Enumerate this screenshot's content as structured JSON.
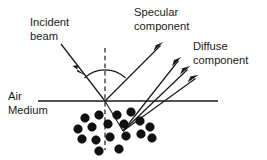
{
  "diagram": {
    "background_color": "#ffffff",
    "ink_color": "#1a1a1a",
    "particle_color": "#111111",
    "width": 267,
    "height": 160,
    "labels": {
      "incident_line1": "Incident",
      "incident_line2": "beam",
      "specular_line1": "Specular",
      "specular_line2": "component",
      "diffuse_line1": "Diffuse",
      "diffuse_line2": "component",
      "air": "Air",
      "medium": "Medium"
    },
    "geometry": {
      "interface": {
        "x1": 38,
        "y1": 101,
        "x2": 218,
        "y2": 101
      },
      "origin": {
        "x": 105,
        "y": 101
      },
      "normal": {
        "x": 105,
        "y_top": 48,
        "y_bottom": 150
      },
      "angle_arc": {
        "radius": 30,
        "start_deg": 133,
        "end_deg": 47
      },
      "incident_ray": {
        "x1": 61,
        "y1": 44,
        "x2": 105,
        "y2": 101
      },
      "incident_arrowhead_at": {
        "x": 80,
        "y": 69,
        "angle_deg": 52
      },
      "specular_ray": {
        "x1": 105,
        "y1": 101,
        "x2": 163,
        "y2": 42
      },
      "refracted_ray": {
        "x1": 105,
        "y1": 101,
        "x2": 123,
        "y2": 131
      },
      "scatter_point": {
        "x": 123,
        "y": 131
      },
      "diffuse_rays": [
        {
          "x1": 123,
          "y1": 131,
          "x2": 181,
          "y2": 57
        },
        {
          "x1": 123,
          "y1": 131,
          "x2": 190,
          "y2": 66
        },
        {
          "x1": 123,
          "y1": 131,
          "x2": 198,
          "y2": 75
        }
      ]
    },
    "particles": [
      {
        "cx": 85,
        "cy": 118,
        "r": 4.3
      },
      {
        "cx": 99,
        "cy": 115,
        "r": 4.3
      },
      {
        "cx": 117,
        "cy": 115,
        "r": 4.3
      },
      {
        "cx": 131,
        "cy": 112,
        "r": 4.3
      },
      {
        "cx": 78,
        "cy": 129,
        "r": 4.3
      },
      {
        "cx": 92,
        "cy": 127,
        "r": 4.3
      },
      {
        "cx": 108,
        "cy": 124,
        "r": 4.3
      },
      {
        "cx": 124,
        "cy": 124,
        "r": 4.3
      },
      {
        "cx": 140,
        "cy": 121,
        "r": 4.3
      },
      {
        "cx": 150,
        "cy": 127,
        "r": 4.3
      },
      {
        "cx": 82,
        "cy": 139,
        "r": 4.3
      },
      {
        "cx": 96,
        "cy": 140,
        "r": 4.3
      },
      {
        "cx": 110,
        "cy": 137,
        "r": 4.3
      },
      {
        "cx": 126,
        "cy": 136,
        "r": 4.3
      },
      {
        "cx": 141,
        "cy": 134,
        "r": 4.3
      },
      {
        "cx": 152,
        "cy": 138,
        "r": 4.3
      },
      {
        "cx": 99,
        "cy": 151,
        "r": 4.3
      },
      {
        "cx": 119,
        "cy": 149,
        "r": 4.3
      }
    ],
    "label_positions": {
      "incident_line1": {
        "x": 30,
        "y": 26
      },
      "incident_line2": {
        "x": 30,
        "y": 40
      },
      "specular_line1": {
        "x": 134,
        "y": 16
      },
      "specular_line2": {
        "x": 134,
        "y": 30
      },
      "diffuse_line1": {
        "x": 193,
        "y": 50
      },
      "diffuse_line2": {
        "x": 193,
        "y": 64
      },
      "air": {
        "x": 8,
        "y": 100
      },
      "medium": {
        "x": 8,
        "y": 114
      }
    }
  }
}
